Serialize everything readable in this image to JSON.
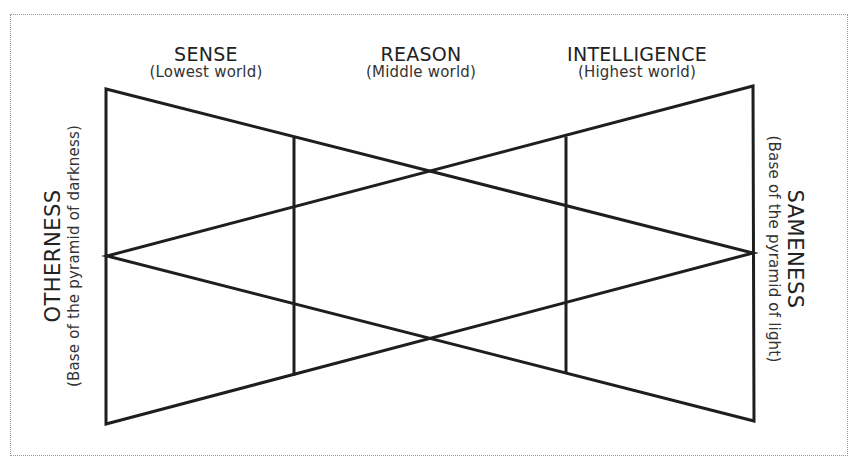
{
  "diagram": {
    "columns": [
      {
        "title": "SENSE",
        "subtitle": "(Lowest world)"
      },
      {
        "title": "REASON",
        "subtitle": "(Middle world)"
      },
      {
        "title": "INTELLIGENCE",
        "subtitle": "(Highest world)"
      }
    ],
    "left_side": {
      "title": "OTHERNESS",
      "subtitle": "(Base of the pyramid of darkness)"
    },
    "right_side": {
      "title": "SAMENESS",
      "subtitle": "(Base of the pyramid of light)"
    },
    "colors": {
      "line": "#1e1e1e",
      "text": "#222222",
      "frame": "#9a9a9a",
      "background": "#ffffff"
    }
  }
}
